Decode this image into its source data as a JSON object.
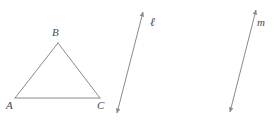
{
  "figure": {
    "background_color": "#ffffff",
    "stroke_color": "#8a8a8a",
    "label_color": "#4a4a4a",
    "stroke_width": 1,
    "triangle": {
      "name": "triangle-abc",
      "vertices": [
        {
          "id": "A",
          "label": "A",
          "x": 15,
          "y": 98
        },
        {
          "id": "B",
          "label": "B",
          "x": 58,
          "y": 43
        },
        {
          "id": "C",
          "label": "C",
          "x": 100,
          "y": 98
        }
      ],
      "sides": [
        {
          "from": "A",
          "to": "B"
        },
        {
          "from": "B",
          "to": "C"
        },
        {
          "from": "A",
          "to": "C"
        }
      ]
    },
    "lines": [
      {
        "id": "l",
        "label": "ℓ",
        "x1": 117,
        "y1": 113,
        "x2": 143,
        "y2": 12,
        "arrow_start": true,
        "arrow_end": true
      },
      {
        "id": "m",
        "label": "m",
        "x1": 230,
        "y1": 112,
        "x2": 256,
        "y2": 10,
        "arrow_start": true,
        "arrow_end": true
      }
    ]
  }
}
